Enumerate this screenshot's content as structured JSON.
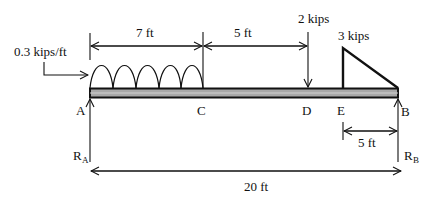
{
  "diagram": {
    "type": "simply-supported beam free-body diagram",
    "points": {
      "A": "A",
      "C": "C",
      "D": "D",
      "E": "E",
      "B": "B"
    },
    "reactions": {
      "left": {
        "main": "R",
        "sub": "A"
      },
      "right": {
        "main": "R",
        "sub": "B"
      }
    },
    "loads": {
      "distributed": "0.3 kips/ft",
      "point": "2 kips",
      "triangular": "3 kips"
    },
    "dimensions": {
      "A_to_C": "7 ft",
      "C_to_D": "5 ft",
      "E_to_B": "5 ft",
      "total": "20 ft"
    },
    "colors": {
      "line": "#111111",
      "beam_fill": "#a8a8a8",
      "background": "#ffffff"
    }
  }
}
